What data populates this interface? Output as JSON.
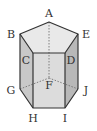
{
  "diagram": {
    "type": "pentagonal-prism",
    "colors": {
      "top_face": "#e9e9e9",
      "front_face": "#d9d9d9",
      "left_face": "#c8c8c8",
      "right_face": "#b7b7b7",
      "edge": "#333333",
      "hidden_edge": "#666666"
    },
    "vertices": {
      "A": {
        "label": "A",
        "x": 49,
        "y": 22,
        "lx": 49,
        "ly": 17
      },
      "B": {
        "label": "B",
        "x": 20,
        "y": 34,
        "lx": 11,
        "ly": 38
      },
      "C": {
        "label": "C",
        "x": 33,
        "y": 53,
        "lx": 26,
        "ly": 64
      },
      "D": {
        "label": "D",
        "x": 65,
        "y": 53,
        "lx": 70,
        "ly": 64
      },
      "E": {
        "label": "E",
        "x": 78,
        "y": 34,
        "lx": 86,
        "ly": 38
      },
      "F": {
        "label": "F",
        "x": 49,
        "y": 78,
        "lx": 49,
        "ly": 89
      },
      "G": {
        "label": "G",
        "x": 20,
        "y": 89,
        "lx": 11,
        "ly": 94
      },
      "H": {
        "label": "H",
        "x": 33,
        "y": 108,
        "lx": 33,
        "ly": 122
      },
      "I": {
        "label": "I",
        "x": 65,
        "y": 108,
        "lx": 65,
        "ly": 122
      },
      "J": {
        "label": "J",
        "x": 78,
        "y": 89,
        "lx": 86,
        "ly": 94
      }
    },
    "hidden_edges": [
      "AF",
      "GF",
      "FJ"
    ]
  }
}
